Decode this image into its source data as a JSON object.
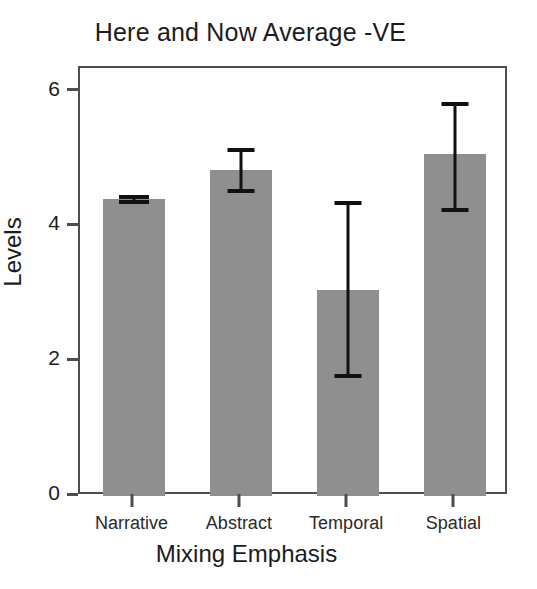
{
  "chart_data": {
    "type": "bar",
    "title": "Here and Now Average -VE",
    "xlabel": "Mixing Emphasis",
    "ylabel": "Levels",
    "categories": [
      "Narrative",
      "Abstract",
      "Temporal",
      "Spatial"
    ],
    "values": [
      4.4,
      4.84,
      3.05,
      5.07
    ],
    "errors_upper": [
      0.04,
      0.29,
      1.29,
      0.75
    ],
    "errors_lower": [
      0.04,
      0.31,
      1.27,
      0.83
    ],
    "error_upper_bounds": [
      4.44,
      5.13,
      4.34,
      5.82
    ],
    "error_lower_bounds": [
      4.36,
      4.53,
      1.78,
      4.24
    ],
    "ylim": [
      0,
      6.35
    ],
    "yticks": [
      0,
      2,
      4,
      6
    ],
    "ytick_labels": [
      "0",
      "2",
      "4",
      "6"
    ],
    "grid": false,
    "legend": null,
    "bar_color": "#8f8f8f",
    "error_color": "#111111",
    "axis_color": "#4e4e4e",
    "background": "#ffffff"
  }
}
